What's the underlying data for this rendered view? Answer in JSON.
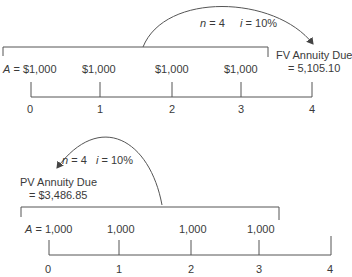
{
  "diagrams": [
    {
      "name": "future-value-annuity-due",
      "rate_label": {
        "n_var": "n",
        "n_val": "= 4",
        "i_var": "i",
        "i_val": "= 10%"
      },
      "result_label": {
        "line1": "FV Annuity Due",
        "line2": "= 5,105.10"
      },
      "payments": [
        {
          "var": "A",
          "eq": "= $1,000"
        },
        {
          "value": "$1,000"
        },
        {
          "value": "$1,000"
        },
        {
          "value": "$1,000"
        }
      ],
      "periods": [
        "0",
        "1",
        "2",
        "3",
        "4"
      ]
    },
    {
      "name": "present-value-annuity-due",
      "rate_label": {
        "n_var": "n",
        "n_val": "= 4",
        "i_var": "i",
        "i_val": "= 10%"
      },
      "result_label": {
        "line1": "PV Annuity Due",
        "line2": "= $3,486.85"
      },
      "payments": [
        {
          "var": "A",
          "eq": "= 1,000"
        },
        {
          "value": "1,000"
        },
        {
          "value": "1,000"
        },
        {
          "value": "1,000"
        }
      ],
      "periods": [
        "0",
        "1",
        "2",
        "3",
        "4"
      ]
    }
  ],
  "colors": {
    "line": "#555555",
    "text": "#3a3a3a"
  }
}
